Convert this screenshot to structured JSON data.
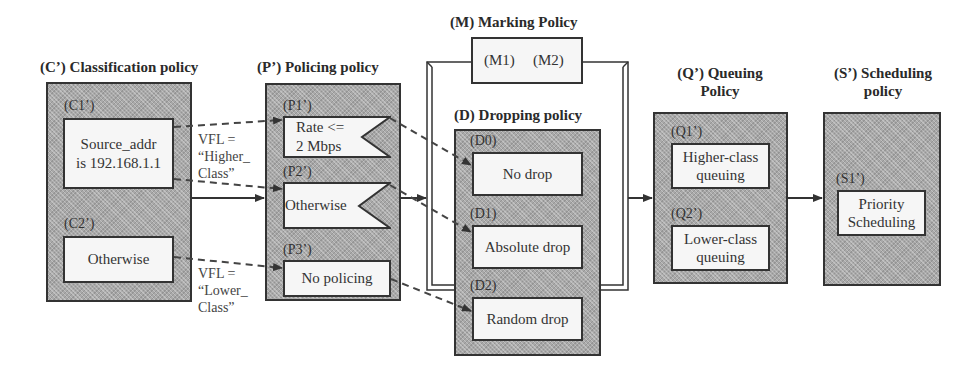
{
  "diagram": {
    "classification": {
      "title": "(C’)  Classification policy",
      "rules": [
        {
          "tag": "(C1’)",
          "text_line1": "Source_addr",
          "text_line2": "is 192.168.1.1"
        },
        {
          "tag": "(C2’)",
          "text": "Otherwise"
        }
      ]
    },
    "vfl_labels": [
      {
        "line1": "VFL =",
        "line2": "“Higher_",
        "line3": "Class”"
      },
      {
        "line1": "VFL =",
        "line2": "“Lower_",
        "line3": "Class”"
      }
    ],
    "policing": {
      "title": "(P’)  Policing policy",
      "rules": [
        {
          "tag": "(P1’)",
          "text_line1": "Rate <=",
          "text_line2": "2 Mbps"
        },
        {
          "tag": "(P2’)",
          "text": "Otherwise"
        },
        {
          "tag": "(P3’)",
          "text": "No policing"
        }
      ]
    },
    "marking": {
      "title": "(M) Marking Policy",
      "rules": [
        "(M1)",
        "(M2)"
      ]
    },
    "dropping": {
      "title": "(D)  Dropping policy",
      "rules": [
        {
          "tag": "(D0)",
          "text": "No drop"
        },
        {
          "tag": "(D1)",
          "text": "Absolute drop"
        },
        {
          "tag": "(D2)",
          "text": "Random drop"
        }
      ]
    },
    "queuing": {
      "title_line1": "(Q’) Queuing",
      "title_line2": "Policy",
      "rules": [
        {
          "tag": "(Q1’)",
          "text_line1": "Higher-class",
          "text_line2": "queuing"
        },
        {
          "tag": "(Q2’)",
          "text_line1": "Lower-class",
          "text_line2": "queuing"
        }
      ]
    },
    "scheduling": {
      "title_line1": "(S’)  Scheduling",
      "title_line2": "policy",
      "rules": [
        {
          "tag": "(S1’)",
          "text_line1": "Priority",
          "text_line2": "Scheduling"
        }
      ]
    },
    "colors": {
      "panel_fill": "#a9a9a9",
      "box_fill": "#f6f6f6",
      "stroke": "#333333"
    }
  }
}
